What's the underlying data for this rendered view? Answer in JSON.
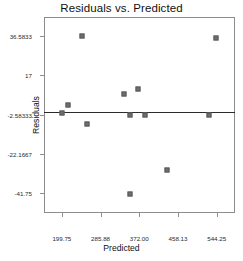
{
  "chart_data": {
    "type": "scatter",
    "title": "Residuals vs. Predicted",
    "xlabel": "Predicted",
    "ylabel": "Residuals",
    "grid": false,
    "legend": null,
    "xlim": [
      160.0,
      585.0
    ],
    "ylim": [
      -51.5,
      46.0
    ],
    "xticks": [
      199.75,
      285.88,
      372.0,
      458.13,
      544.25
    ],
    "xtick_labels": [
      "199.75",
      "285.88",
      "372.00",
      "458.13",
      "544.25"
    ],
    "yticks": [
      36.5833,
      17,
      -2.58333,
      -22.1667,
      -41.75
    ],
    "ytick_labels": [
      "36.5833",
      "17",
      "-2.58333",
      "-22.1667",
      "-41.75"
    ],
    "reference_line": {
      "orientation": "horizontal",
      "y": -1.2,
      "color": "#2b2b2b"
    },
    "marker": {
      "shape": "square",
      "color": "#6e6e6e",
      "size": 5
    },
    "points": [
      {
        "x": 199.8,
        "y": -1.6
      },
      {
        "x": 213.0,
        "y": 2.4
      },
      {
        "x": 245.0,
        "y": 36.6
      },
      {
        "x": 256.0,
        "y": -7.2
      },
      {
        "x": 337.0,
        "y": 7.6
      },
      {
        "x": 352.0,
        "y": -2.9
      },
      {
        "x": 352.0,
        "y": -41.8
      },
      {
        "x": 369.0,
        "y": 10.2
      },
      {
        "x": 385.0,
        "y": -2.9
      },
      {
        "x": 433.0,
        "y": -30.2
      },
      {
        "x": 528.0,
        "y": -2.9
      },
      {
        "x": 543.0,
        "y": 35.6
      }
    ]
  }
}
